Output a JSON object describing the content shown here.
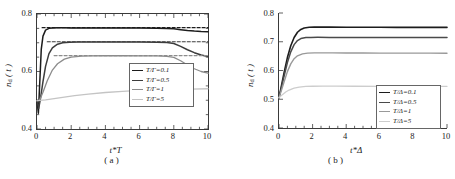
{
  "figure": {
    "caption_a": "( a )",
    "caption_b": "( b )"
  },
  "chart_data": [
    {
      "panel": "a",
      "type": "line",
      "title": "",
      "xlabel": "t*T",
      "ylabel": "n_d (t)",
      "ylabel_base": "n",
      "ylabel_sub": "d",
      "ylabel_arg": " ( t )",
      "xlim": [
        0,
        10
      ],
      "ylim": [
        0.4,
        0.8
      ],
      "xticks": [
        0,
        2,
        4,
        6,
        8,
        10
      ],
      "xticklabels": [
        "0",
        "2",
        "4",
        "6",
        "8",
        "10"
      ],
      "yticks": [
        0.4,
        0.6,
        0.8
      ],
      "yticklabels": [
        "0.4",
        "0.6",
        "0.8"
      ],
      "yminor": [
        0.45,
        0.5,
        0.55,
        0.65,
        0.7,
        0.75
      ],
      "grid": false,
      "legend_position": "lower-right-inside",
      "legend_title": "",
      "series": [
        {
          "name": "T/Γ=0.1",
          "color": "#1c1c1c",
          "width": 1.5,
          "style": "solid",
          "x": [
            0,
            0.08,
            0.16,
            0.25,
            0.35,
            0.5,
            0.7,
            0.9,
            1.2,
            1.6,
            2.0,
            2.6,
            3.2,
            4.0,
            5.0,
            6.0,
            7.0,
            7.6,
            8.0,
            8.4,
            8.8,
            9.2,
            9.6,
            10.0
          ],
          "y": [
            0.5,
            0.455,
            0.56,
            0.678,
            0.723,
            0.744,
            0.75,
            0.7515,
            0.7518,
            0.7518,
            0.7517,
            0.7516,
            0.7515,
            0.7513,
            0.7511,
            0.7509,
            0.7505,
            0.75,
            0.7485,
            0.7455,
            0.7425,
            0.7405,
            0.7392,
            0.7385
          ]
        },
        {
          "name": "T/Γ=0.1 (asymptote)",
          "color": "#1c1c1c",
          "width": 1.2,
          "style": "dashed",
          "x": [
            0.3,
            10
          ],
          "y": [
            0.7525,
            0.7525
          ]
        },
        {
          "name": "T/Γ=0.5",
          "color": "#3d3d3d",
          "width": 1.5,
          "style": "solid",
          "x": [
            0,
            0.1,
            0.2,
            0.35,
            0.5,
            0.7,
            0.9,
            1.2,
            1.5,
            1.9,
            2.4,
            3.0,
            4.0,
            5.0,
            6.0,
            7.0,
            7.6,
            8.0,
            8.4,
            8.8,
            9.2,
            9.6,
            10.0
          ],
          "y": [
            0.498,
            0.472,
            0.505,
            0.565,
            0.618,
            0.662,
            0.682,
            0.695,
            0.7,
            0.7018,
            0.7024,
            0.7026,
            0.7026,
            0.7025,
            0.7024,
            0.702,
            0.701,
            0.6975,
            0.6875,
            0.6755,
            0.6655,
            0.6575,
            0.6525
          ]
        },
        {
          "name": "T/Γ=0.5 (asymptote)",
          "color": "#3d3d3d",
          "width": 1.2,
          "style": "dashed",
          "x": [
            0.6,
            10
          ],
          "y": [
            0.7035,
            0.7035
          ]
        },
        {
          "name": "T/Γ=1",
          "color": "#8c8c8c",
          "width": 1.3,
          "style": "solid",
          "x": [
            0,
            0.15,
            0.35,
            0.6,
            0.9,
            1.2,
            1.6,
            2.0,
            2.6,
            3.2,
            4.0,
            5.0,
            6.0,
            7.0,
            7.6,
            8.0,
            8.4,
            8.8,
            9.2,
            9.6,
            10.0
          ],
          "y": [
            0.498,
            0.5,
            0.528,
            0.568,
            0.605,
            0.627,
            0.643,
            0.65,
            0.6535,
            0.6545,
            0.6548,
            0.6548,
            0.6546,
            0.654,
            0.6528,
            0.649,
            0.6375,
            0.6225,
            0.6095,
            0.6,
            0.594
          ]
        },
        {
          "name": "T/Γ=1 (asymptote)",
          "color": "#8c8c8c",
          "width": 1.2,
          "style": "dashed",
          "x": [
            1.0,
            10
          ],
          "y": [
            0.6555,
            0.6555
          ]
        },
        {
          "name": "T/Γ=5",
          "color": "#c4c4c4",
          "width": 1.3,
          "style": "solid",
          "x": [
            0,
            0.5,
            1.0,
            1.6,
            2.2,
            3.0,
            4.0,
            5.0,
            6.0,
            7.0,
            8.0,
            9.0,
            10.0
          ],
          "y": [
            0.4985,
            0.501,
            0.5055,
            0.511,
            0.516,
            0.5215,
            0.527,
            0.531,
            0.534,
            0.536,
            0.5378,
            0.539,
            0.54
          ]
        }
      ],
      "legend_entries": [
        {
          "label": "T/Γ=0.1",
          "color": "#1c1c1c",
          "width": 1.5
        },
        {
          "label": "T/Γ=0.5",
          "color": "#3d3d3d",
          "width": 1.5
        },
        {
          "label": "T/Γ=1",
          "color": "#8c8c8c",
          "width": 1.2
        },
        {
          "label": "T/Γ=5",
          "color": "#c4c4c4",
          "width": 1.1
        }
      ]
    },
    {
      "panel": "b",
      "type": "line",
      "title": "",
      "xlabel": "t*Δ",
      "ylabel": "n_d (t)",
      "ylabel_base": "n",
      "ylabel_sub": "d",
      "ylabel_arg": " ( t )",
      "xlim": [
        0,
        10
      ],
      "ylim": [
        0.4,
        0.8
      ],
      "xticks": [
        0,
        2,
        4,
        6,
        8,
        10
      ],
      "xticklabels": [
        "0",
        "2",
        "4",
        "6",
        "8",
        "10"
      ],
      "yticks": [
        0.4,
        0.5,
        0.6,
        0.7,
        0.8
      ],
      "yticklabels": [
        "0.4",
        "0.5",
        "0.6",
        "0.7",
        "0.8"
      ],
      "yminor": [],
      "grid": false,
      "legend_position": "lower-right-inside",
      "legend_title": "",
      "series": [
        {
          "name": "T/Δ=0.1",
          "color": "#1c1c1c",
          "width": 1.6,
          "style": "solid",
          "x": [
            0,
            0.15,
            0.3,
            0.5,
            0.7,
            0.9,
            1.1,
            1.3,
            1.5,
            1.8,
            2.1,
            2.5,
            3.0,
            4.0,
            5.0,
            6.0,
            7.0,
            8.0,
            9.0,
            10.0
          ],
          "y": [
            0.505,
            0.548,
            0.592,
            0.645,
            0.686,
            0.715,
            0.733,
            0.743,
            0.748,
            0.7505,
            0.751,
            0.751,
            0.7508,
            0.7505,
            0.7503,
            0.7502,
            0.7501,
            0.75,
            0.75,
            0.75
          ]
        },
        {
          "name": "T/Δ=0.5",
          "color": "#4a4a4a",
          "width": 1.5,
          "style": "solid",
          "x": [
            0,
            0.15,
            0.3,
            0.5,
            0.7,
            0.9,
            1.1,
            1.3,
            1.6,
            1.9,
            2.3,
            3.0,
            4.0,
            5.0,
            6.0,
            7.0,
            8.0,
            9.0,
            10.0
          ],
          "y": [
            0.505,
            0.542,
            0.58,
            0.628,
            0.665,
            0.69,
            0.704,
            0.711,
            0.7145,
            0.7152,
            0.7153,
            0.7152,
            0.715,
            0.7148,
            0.7147,
            0.7146,
            0.7145,
            0.7145,
            0.7145
          ]
        },
        {
          "name": "T/Δ=1",
          "color": "#999999",
          "width": 1.4,
          "style": "solid",
          "x": [
            0,
            0.15,
            0.3,
            0.5,
            0.7,
            0.9,
            1.1,
            1.4,
            1.7,
            2.1,
            2.6,
            3.2,
            4.0,
            5.0,
            6.0,
            7.0,
            8.0,
            9.0,
            10.0
          ],
          "y": [
            0.505,
            0.532,
            0.56,
            0.596,
            0.623,
            0.641,
            0.651,
            0.658,
            0.6605,
            0.6612,
            0.6613,
            0.6612,
            0.661,
            0.6608,
            0.6606,
            0.6605,
            0.6604,
            0.6603,
            0.6602
          ]
        },
        {
          "name": "T/Δ=5",
          "color": "#cdcdcd",
          "width": 1.3,
          "style": "solid",
          "x": [
            0,
            0.2,
            0.4,
            0.6,
            0.9,
            1.2,
            1.6,
            2.0,
            2.6,
            3.4,
            4.5,
            6.0,
            8.0,
            10.0
          ],
          "y": [
            0.505,
            0.516,
            0.525,
            0.532,
            0.539,
            0.5425,
            0.5445,
            0.5452,
            0.5455,
            0.5455,
            0.5453,
            0.5451,
            0.545,
            0.545
          ]
        }
      ],
      "legend_entries": [
        {
          "label": "T/Δ=0.1",
          "color": "#1c1c1c",
          "width": 1.6
        },
        {
          "label": "T/Δ=0.5",
          "color": "#4a4a4a",
          "width": 1.5
        },
        {
          "label": "T/Δ=1",
          "color": "#999999",
          "width": 1.2
        },
        {
          "label": "T/Δ=5",
          "color": "#cdcdcd",
          "width": 1.1
        }
      ]
    }
  ]
}
